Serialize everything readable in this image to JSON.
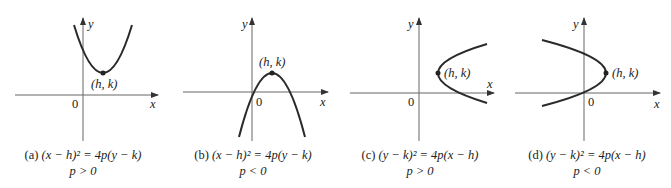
{
  "figure": {
    "panels": [
      {
        "id": "a",
        "caption_tag": "(a)",
        "equation": "(x − h)² = 4p(y − k)",
        "condition": "p > 0",
        "vertex_label": "(h, k)",
        "origin_label": "0",
        "x_axis_label": "x",
        "y_axis_label": "y",
        "opens": "up"
      },
      {
        "id": "b",
        "caption_tag": "(b)",
        "equation": "(x − h)² = 4p(y − k)",
        "condition": "p < 0",
        "vertex_label": "(h, k)",
        "origin_label": "0",
        "x_axis_label": "x",
        "y_axis_label": "y",
        "opens": "down"
      },
      {
        "id": "c",
        "caption_tag": "(c)",
        "equation": "(y − k)² = 4p(x − h)",
        "condition": "p > 0",
        "vertex_label": "(h, k)",
        "origin_label": "0",
        "x_axis_label": "x",
        "y_axis_label": "y",
        "opens": "right"
      },
      {
        "id": "d",
        "caption_tag": "(d)",
        "equation": "(y − k)² = 4p(x − h)",
        "condition": "p < 0",
        "vertex_label": "(h, k)",
        "origin_label": "0",
        "x_axis_label": "x",
        "y_axis_label": "y",
        "opens": "left"
      }
    ],
    "colors": {
      "curve": "#2a2a2a",
      "axis": "#555555",
      "text": "#222222"
    }
  }
}
